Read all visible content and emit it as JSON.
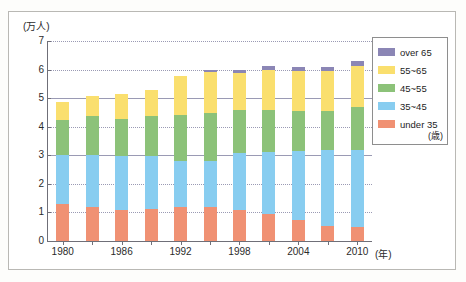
{
  "axes": {
    "y_unit_label": "(万人)",
    "x_unit_label": "(年)",
    "y_ticks": [
      "0",
      "1",
      "2",
      "3",
      "4",
      "5",
      "6",
      "7"
    ],
    "x_ticks": [
      "1980",
      "1986",
      "1992",
      "1998",
      "2004",
      "2010"
    ]
  },
  "legend": {
    "unit_note": "(歳)",
    "items": [
      {
        "label": "over 65",
        "color": "#8b86b5"
      },
      {
        "label": "55~65",
        "color": "#fadf6e"
      },
      {
        "label": "45~55",
        "color": "#8cc279"
      },
      {
        "label": "35~45",
        "color": "#88cdf0"
      },
      {
        "label": "under 35",
        "color": "#f09173"
      }
    ]
  },
  "chart_data": {
    "type": "bar",
    "stacked": true,
    "title": "",
    "subtitle": "",
    "xlabel": "(年)",
    "ylabel": "(万人)",
    "ylim": [
      0,
      7
    ],
    "ytick_step": 1,
    "grid": true,
    "legend_position": "right",
    "categories": [
      "1980",
      "1983",
      "1986",
      "1989",
      "1992",
      "1995",
      "1998",
      "2001",
      "2004",
      "2007",
      "2010"
    ],
    "tick_labels_shown": [
      "1980",
      "",
      "1986",
      "",
      "1992",
      "",
      "1998",
      "",
      "2004",
      "",
      "2010"
    ],
    "series": [
      {
        "name": "under 35",
        "color": "#f09173",
        "values": [
          1.3,
          1.2,
          1.1,
          1.12,
          1.18,
          1.18,
          1.1,
          0.95,
          0.75,
          0.52,
          0.5
        ]
      },
      {
        "name": "35~45",
        "color": "#88cdf0",
        "values": [
          1.7,
          1.8,
          1.88,
          1.86,
          1.62,
          1.62,
          1.98,
          2.15,
          2.4,
          2.65,
          2.7
        ]
      },
      {
        "name": "45~55",
        "color": "#8cc279",
        "values": [
          1.25,
          1.37,
          1.28,
          1.38,
          1.62,
          1.67,
          1.52,
          1.48,
          1.4,
          1.38,
          1.5
        ]
      },
      {
        "name": "55~65",
        "color": "#fadf6e",
        "values": [
          0.6,
          0.72,
          0.88,
          0.92,
          1.35,
          1.43,
          1.29,
          1.4,
          1.4,
          1.4,
          1.43
        ]
      },
      {
        "name": "over 65",
        "color": "#8b86b5",
        "values": [
          0.0,
          0.0,
          0.0,
          0.0,
          0.0,
          0.08,
          0.1,
          0.13,
          0.14,
          0.14,
          0.18
        ]
      }
    ],
    "totals": [
      4.85,
      5.09,
      5.14,
      5.28,
      5.77,
      5.98,
      5.99,
      6.11,
      6.09,
      6.09,
      6.31
    ]
  }
}
